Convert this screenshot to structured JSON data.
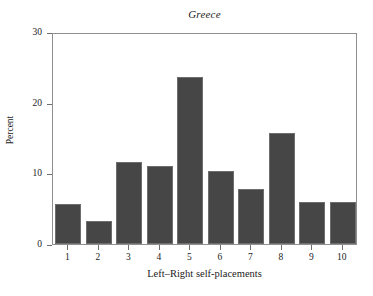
{
  "chart_data": {
    "type": "bar",
    "title": "Greece",
    "xlabel": "Left–Right self-placements",
    "ylabel": "Percent",
    "categories": [
      "1",
      "2",
      "3",
      "4",
      "5",
      "6",
      "7",
      "8",
      "9",
      "10"
    ],
    "values": [
      5.7,
      3.3,
      11.6,
      11.1,
      23.6,
      10.3,
      7.8,
      15.7,
      5.9,
      5.9
    ],
    "ylim": [
      0,
      30
    ],
    "yticks": [
      "0",
      "10",
      "20",
      "30"
    ],
    "ytick_values": [
      0,
      10,
      20,
      30
    ],
    "grid": false,
    "legend": "none",
    "bar_color": "#464646",
    "bar_edge_color": "#6d6d6d",
    "frame_color": "#8f8f8f",
    "axis_text_color": "#222222"
  }
}
